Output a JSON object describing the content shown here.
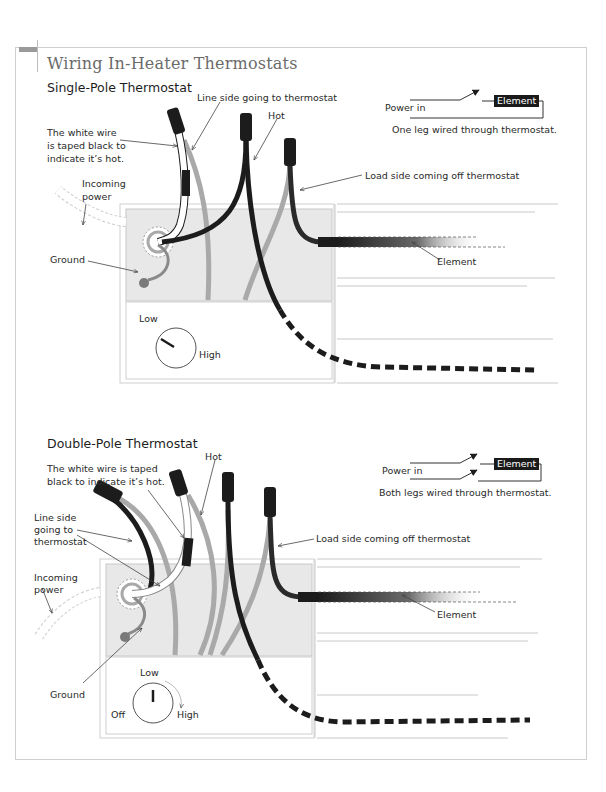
{
  "title": "Wiring In-Heater Thermostats",
  "single_pole": {
    "heading": "Single-Pole Thermostat",
    "labels": {
      "line_side": "Line side going to thermostat",
      "hot": "Hot",
      "white_wire": [
        "The white wire",
        "is taped black to",
        "indicate it’s hot."
      ],
      "incoming_power": [
        "Incoming",
        "power"
      ],
      "ground": "Ground",
      "load_side": "Load side coming off thermostat",
      "element": "Element",
      "dial_low": "Low",
      "dial_high": "High"
    },
    "schematic": {
      "power_in": "Power in",
      "element": "Element",
      "caption": "One leg wired through thermostat."
    }
  },
  "double_pole": {
    "heading": "Double-Pole Thermostat",
    "labels": {
      "hot": "Hot",
      "white_wire": [
        "The white wire is taped",
        "black to indicate it’s hot."
      ],
      "line_side": [
        "Line side",
        "going to",
        "thermostat"
      ],
      "incoming_power": [
        "Incoming",
        "power"
      ],
      "ground": "Ground",
      "load_side": "Load side coming off thermostat",
      "element": "Element",
      "dial_low": "Low",
      "dial_off": "Off",
      "dial_high": "High"
    },
    "schematic": {
      "power_in": "Power in",
      "element": "Element",
      "caption": "Both legs wired through thermostat."
    }
  },
  "colors": {
    "wire_black": "#1c1c1c",
    "wire_gray": "#a9a9a9",
    "panel_fill": "#e8e8e8",
    "frame_line": "#cfcfcf"
  }
}
